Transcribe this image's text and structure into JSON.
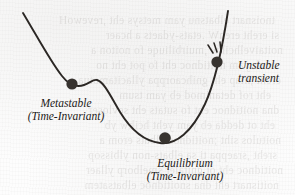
{
  "figure": {
    "type": "energy-landscape-diagram",
    "caption_labels": {
      "metastable": {
        "line1": "Metastable",
        "line2": "(Time-Invariant)"
      },
      "equilibrium": {
        "line1": "Equilibrium",
        "line2": "(Time-Invariant)"
      },
      "unstable": {
        "line1": "Unstable",
        "line2": "transient"
      }
    },
    "colors": {
      "curve": "#2b2724",
      "ball": "#37332f",
      "text": "#1d1a18",
      "paper": "#fdfdfd"
    },
    "markers": [
      {
        "name": "metastable-ball",
        "x": 72,
        "y": 84,
        "r": 5.6
      },
      {
        "name": "equilibrium-ball",
        "x": 165,
        "y": 138,
        "r": 5.8
      },
      {
        "name": "unstable-ball",
        "x": 217,
        "y": 62,
        "r": 5.6
      }
    ],
    "curve_path": "M 23,13 C 38,38 52,64 62,76 C 69,85 76,88 84,85 C 90,83 93,79 97,80 C 104,82 110,95 120,112 C 131,130 143,141 160,143 C 176,145 192,132 205,104 C 216,80 223,44 228,11",
    "motion_lines": [
      {
        "name": "motion-line-1",
        "x1": 213,
        "y1": 53,
        "x2": 208,
        "y2": 45
      },
      {
        "name": "motion-line-2",
        "x1": 217,
        "y1": 52,
        "x2": 214,
        "y2": 43
      },
      {
        "name": "motion-line-3",
        "x1": 221,
        "y1": 52,
        "x2": 220,
        "y2": 42
      }
    ],
    "bleed_through_lines": [
      {
        "text": "tnoisnart elbatsnu yam metsys eht ,revewoH",
        "x": 20,
        "y": 14
      },
      {
        "text": "si ereht erehW .etats-ydaets a hcaer",
        "x": 16,
        "y": 29
      },
      {
        "text": "noitaivelhcihw ,muirbiliuqe fo noiton a",
        "x": 12,
        "y": 44
      },
      {
        "text": "ni eb yam noitidnoc eht fo pot eht no",
        "x": 18,
        "y": 59
      },
      {
        "text": "ereht ,htap eht gnihcaorppa yllacitamotua",
        "x": 14,
        "y": 74
      },
      {
        "text": "eht rof detanimod eb yam tsum",
        "x": 24,
        "y": 89
      },
      {
        "text": "dna noitidnoc eht fo sutats eht sevloser",
        "x": 16,
        "y": 104
      },
      {
        "text": "eht ot dedda eb yam yeht hcihw yb",
        "x": 20,
        "y": 119
      },
      {
        "text": "noitulos siht ;noitidnoc elbats erom a",
        "x": 14,
        "y": 134
      },
      {
        "text": "sreht ,sraeppa ti sa elbats-non ylbissop",
        "x": 18,
        "y": 149
      },
      {
        "text": "noitidnoc eht ot gnitaler smelborp yllaer",
        "x": 12,
        "y": 164
      },
      {
        "text": "noitisnart eht dna snoitidnoc elbatsatem",
        "x": 16,
        "y": 179
      }
    ]
  }
}
